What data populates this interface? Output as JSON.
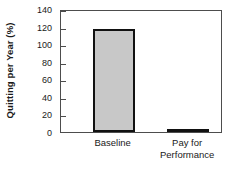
{
  "chart_data": {
    "type": "bar",
    "title": "",
    "subtitle": "",
    "xlabel": "",
    "ylabel": "Quitting per Year (%)",
    "categories": [
      "Baseline",
      "Pay for\nPerformance"
    ],
    "values": [
      117,
      3
    ],
    "ylim": [
      0,
      140
    ],
    "yticks": [
      0,
      20,
      40,
      60,
      80,
      100,
      120,
      140
    ],
    "ytick_labels": [
      "0",
      "20",
      "40",
      "60",
      "80",
      "100",
      "120",
      "140"
    ],
    "grid": false,
    "legend": null,
    "series": [
      {
        "name": "Quitting per Year",
        "values": [
          117,
          3
        ]
      }
    ],
    "colors": {
      "bar_fill": "#c8c8c8",
      "bar_edge": "#111111",
      "axis": "#4d4d4d",
      "text": "#1a1a1a",
      "background": "#ffffff"
    },
    "annotations": []
  }
}
